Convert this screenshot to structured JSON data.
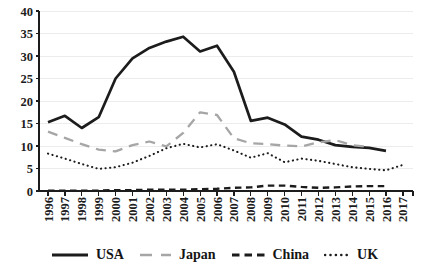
{
  "chart_data": {
    "type": "line",
    "title": "",
    "xlabel": "",
    "ylabel": "",
    "x": [
      1996,
      1997,
      1998,
      1999,
      2000,
      2001,
      2002,
      2003,
      2004,
      2005,
      2006,
      2007,
      2008,
      2009,
      2010,
      2011,
      2012,
      2013,
      2014,
      2015,
      2016,
      2017
    ],
    "ylim": [
      0,
      40
    ],
    "yticks": [
      0,
      5,
      10,
      15,
      20,
      25,
      30,
      35,
      40
    ],
    "grid": "horizontal-light",
    "legend_position": "bottom",
    "series": [
      {
        "name": "USA",
        "color": "#1c1c1c",
        "style": "solid",
        "values": [
          15.3,
          16.7,
          14.0,
          16.4,
          25.0,
          29.5,
          31.8,
          33.2,
          34.3,
          31.0,
          32.3,
          26.5,
          15.6,
          16.3,
          14.8,
          12.1,
          11.4,
          10.2,
          9.8,
          9.6,
          8.9,
          null
        ]
      },
      {
        "name": "Japan",
        "color": "#a6a6a6",
        "style": "long-dash",
        "values": [
          13.2,
          11.8,
          10.4,
          9.2,
          8.8,
          10.2,
          11.0,
          9.9,
          12.9,
          17.5,
          16.9,
          11.7,
          10.6,
          10.4,
          10.1,
          9.9,
          10.8,
          11.3,
          10.2,
          9.8,
          null,
          null
        ]
      },
      {
        "name": "China",
        "color": "#1c1c1c",
        "style": "dash",
        "values": [
          0.1,
          0.1,
          0.1,
          0.1,
          0.2,
          0.2,
          0.3,
          0.3,
          0.3,
          0.4,
          0.5,
          0.7,
          0.8,
          1.2,
          1.2,
          0.9,
          0.7,
          0.8,
          1.0,
          1.1,
          1.1,
          null
        ]
      },
      {
        "name": "UK",
        "color": "#1c1c1c",
        "style": "dot",
        "values": [
          8.3,
          7.2,
          6.0,
          4.9,
          5.3,
          6.3,
          7.8,
          9.5,
          10.5,
          9.7,
          10.4,
          9.0,
          7.4,
          8.4,
          6.4,
          7.2,
          6.7,
          6.0,
          5.3,
          4.9,
          4.6,
          5.8
        ]
      }
    ],
    "colors": {
      "axis": "#1c1c1c",
      "grid": "#ececec",
      "background": "#ffffff",
      "japan_gray": "#a6a6a6"
    }
  }
}
